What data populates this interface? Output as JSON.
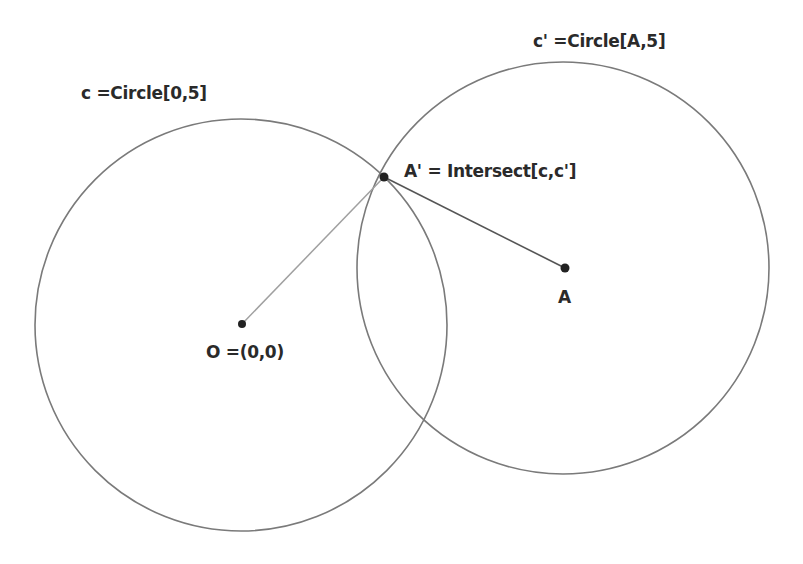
{
  "diagram": {
    "type": "geometry-construction",
    "colors": {
      "background": "#ffffff",
      "circle_stroke": "#7a7a7a",
      "segment_OA1": "#a0a0a0",
      "segment_A1A": "#555555",
      "point_fill": "#222222",
      "label_text": "#2a2a2a"
    },
    "circles": [
      {
        "name": "c",
        "cx": 241,
        "cy": 325,
        "r": 206
      },
      {
        "name": "c'",
        "cx": 563,
        "cy": 268,
        "r": 206
      }
    ],
    "points": [
      {
        "name": "O",
        "x": 242,
        "y": 324
      },
      {
        "name": "A",
        "x": 565,
        "y": 268
      },
      {
        "name": "A'",
        "x": 384,
        "y": 177
      }
    ],
    "segments": [
      {
        "from": "O",
        "to": "A'"
      },
      {
        "from": "A'",
        "to": "A"
      }
    ],
    "labels": {
      "circle_c": "c =Circle[0,5]",
      "circle_c_prime": "c' =Circle[A,5]",
      "intersection": "A' = Intersect[c,c']",
      "point_A": "A",
      "point_O": "O =(0,0)"
    }
  }
}
